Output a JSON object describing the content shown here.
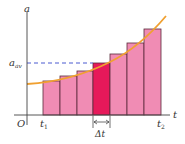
{
  "diagram": {
    "axes": {
      "y_label": "a",
      "x_label": "t",
      "origin_label": "O"
    },
    "annotations": {
      "a_avg_main": "a",
      "a_avg_sub": "av",
      "t1_main": "t",
      "t1_sub": "1",
      "t2_main": "t",
      "t2_sub": "2",
      "delta_t": "Δt"
    },
    "colors": {
      "bar_fill": "#f08cb4",
      "highlight_fill": "#e6195a",
      "bar_stroke": "#5a2a3a",
      "curve": "#f0a030",
      "dashed": "#4a5ad0",
      "axis": "#444444"
    },
    "bars": [
      {
        "index": 1,
        "highlighted": false
      },
      {
        "index": 2,
        "highlighted": false
      },
      {
        "index": 3,
        "highlighted": false
      },
      {
        "index": 4,
        "highlighted": true
      },
      {
        "index": 5,
        "highlighted": false
      },
      {
        "index": 6,
        "highlighted": false
      },
      {
        "index": 7,
        "highlighted": false
      }
    ]
  }
}
